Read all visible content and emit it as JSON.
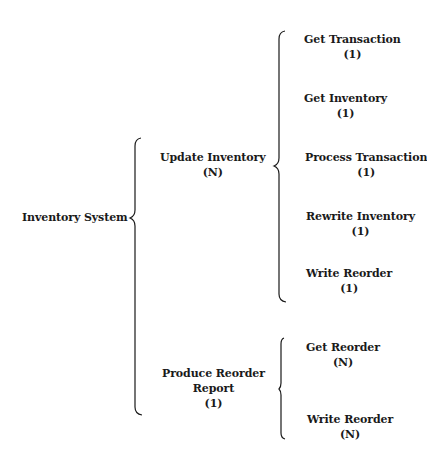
{
  "diagram": {
    "type": "warnier-orr",
    "root": {
      "label": "Inventory System"
    },
    "level1": [
      {
        "label": "Update Inventory",
        "count": "(N)"
      },
      {
        "label_line1": "Produce Reorder",
        "label_line2": "Report",
        "count": "(1)"
      }
    ],
    "update_children": [
      {
        "label": "Get Transaction",
        "count": "(1)"
      },
      {
        "label": "Get Inventory",
        "count": "(1)"
      },
      {
        "label": "Process Transaction",
        "count": "(1)"
      },
      {
        "label": "Rewrite Inventory",
        "count": "(1)"
      },
      {
        "label": "Write Reorder",
        "count": "(1)"
      }
    ],
    "report_children": [
      {
        "label": "Get Reorder",
        "count": "(N)"
      },
      {
        "label": "Write Reorder",
        "count": "(N)"
      }
    ],
    "colors": {
      "ink": "#1a1a1a",
      "background": "#ffffff"
    }
  }
}
